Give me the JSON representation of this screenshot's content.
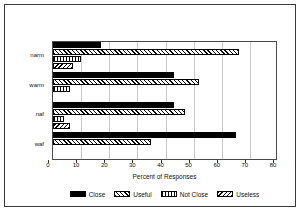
{
  "chart_data": {
    "type": "bar",
    "orientation": "horizontal",
    "title": "",
    "xlabel": "Percent of Responses",
    "ylabel": "",
    "xlim": [
      0,
      80
    ],
    "xticks": [
      0,
      10,
      20,
      30,
      40,
      50,
      60,
      70,
      80
    ],
    "grid": true,
    "legend_position": "bottom",
    "categories": [
      "narm",
      "warm",
      "naf",
      "waf"
    ],
    "series": [
      {
        "name": "Close",
        "pattern": "solid",
        "values": [
          17,
          43,
          43,
          65
        ]
      },
      {
        "name": "Useful",
        "pattern": "diagonal",
        "values": [
          66,
          52,
          47,
          35
        ]
      },
      {
        "name": "Not Close",
        "pattern": "crosshatch",
        "values": [
          10,
          6,
          4,
          0
        ]
      },
      {
        "name": "Useless",
        "pattern": "backslash",
        "values": [
          7,
          0,
          6,
          0
        ]
      }
    ]
  },
  "legend": {
    "items": [
      {
        "label": "Close"
      },
      {
        "label": "Useful"
      },
      {
        "label": "Not Close"
      },
      {
        "label": "Useless"
      }
    ]
  }
}
